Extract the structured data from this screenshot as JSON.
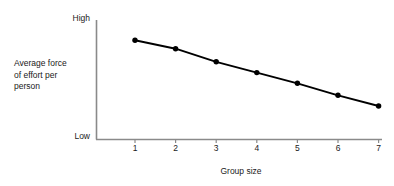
{
  "chart_data": {
    "type": "line",
    "title": "",
    "subtitle": "",
    "xlabel": "Group size",
    "ylabel": "Average force\nof effort per\nperson",
    "ylabel_lines": [
      "Average force",
      "of effort per",
      "person"
    ],
    "x": [
      1,
      2,
      3,
      4,
      5,
      6,
      7
    ],
    "categories": [
      "1",
      "2",
      "3",
      "4",
      "5",
      "6",
      "7"
    ],
    "xtick_labels": [
      "1",
      "2",
      "3",
      "4",
      "5",
      "6",
      "7"
    ],
    "ytick_labels": [
      "Low",
      "High"
    ],
    "y_axis_low_label": "Low",
    "y_axis_high_label": "High",
    "xlim": [
      0.5,
      7.4
    ],
    "ylim": [
      0,
      100
    ],
    "grid": false,
    "legend": null,
    "legend_position": "none",
    "marker": "filled-circle",
    "series": [
      {
        "name": "Average force of effort per person",
        "values": [
          83,
          76,
          65,
          56,
          47,
          37,
          28
        ]
      }
    ],
    "annotations": [],
    "colors": {
      "line": "#000000",
      "marker": "#000000",
      "axis": "#8a8a8a",
      "text": "#1a1a1a",
      "background": "#ffffff"
    }
  }
}
